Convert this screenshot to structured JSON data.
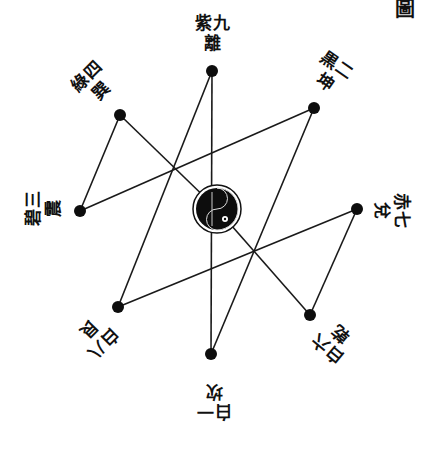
{
  "diagram": {
    "corner_char": "圖",
    "center": {
      "x": 217,
      "y": 209,
      "r": 22,
      "symbol": "taijitu-icon",
      "number": 5
    },
    "palaces": [
      {
        "id": "kan",
        "number": 1,
        "label": "一白坎",
        "x": 211,
        "y": 354,
        "label_x": 214,
        "label_y": 400,
        "rotate": 180
      },
      {
        "id": "kun",
        "number": 2,
        "label": "二黒坤",
        "x": 314,
        "y": 108,
        "label_x": 330,
        "label_y": 75,
        "rotate": 35
      },
      {
        "id": "zhen",
        "number": 3,
        "label": "三碧震",
        "x": 80,
        "y": 211,
        "label_x": 45,
        "label_y": 208,
        "rotate": -90
      },
      {
        "id": "xun",
        "number": 4,
        "label": "四綠巽",
        "x": 120,
        "y": 115,
        "label_x": 95,
        "label_y": 85,
        "rotate": -45
      },
      {
        "id": "qian",
        "number": 6,
        "label": "六白乾",
        "x": 310,
        "y": 315,
        "label_x": 335,
        "label_y": 340,
        "rotate": -140
      },
      {
        "id": "dui",
        "number": 7,
        "label": "七赤兌",
        "x": 357,
        "y": 209,
        "label_x": 390,
        "label_y": 210,
        "rotate": 90
      },
      {
        "id": "gen",
        "number": 8,
        "label": "八白艮",
        "x": 118,
        "y": 307,
        "label_x": 95,
        "label_y": 335,
        "rotate": 135
      },
      {
        "id": "li",
        "number": 9,
        "label": "九紫離",
        "x": 212,
        "y": 71,
        "label_x": 212,
        "label_y": 35,
        "rotate": 0
      }
    ],
    "path_order": [
      1,
      2,
      3,
      4,
      5,
      6,
      7,
      8,
      9
    ],
    "extra_line": [
      9,
      1
    ]
  }
}
